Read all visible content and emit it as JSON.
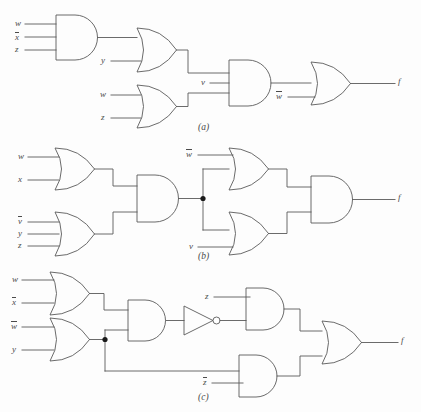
{
  "figure": {
    "type": "logic-circuit-diagram",
    "background_color": "#fdfdfd",
    "line_color": "#5a5a5a",
    "text_color": "#4a4a4a",
    "panels": [
      {
        "caption": "(a)",
        "output_label": "f",
        "gates": [
          {
            "name": "and-gate-a1",
            "kind": "AND",
            "inputs": [
              "w",
              "x̅",
              "z"
            ]
          },
          {
            "name": "or-gate-a1",
            "kind": "OR",
            "inputs": [
              "and-gate-a1",
              "y"
            ]
          },
          {
            "name": "or-gate-a2",
            "kind": "OR",
            "inputs": [
              "w",
              "z"
            ]
          },
          {
            "name": "and-gate-a2",
            "kind": "AND",
            "inputs": [
              "or-gate-a1",
              "v",
              "or-gate-a2"
            ]
          },
          {
            "name": "or-gate-a3",
            "kind": "OR",
            "inputs": [
              "and-gate-a2",
              "w̅"
            ]
          }
        ],
        "input_labels": [
          {
            "text": "w",
            "overbar": false
          },
          {
            "text": "x",
            "overbar": true
          },
          {
            "text": "z",
            "overbar": false
          },
          {
            "text": "y",
            "overbar": false
          },
          {
            "text": "w",
            "overbar": false
          },
          {
            "text": "z",
            "overbar": false
          },
          {
            "text": "v",
            "overbar": false
          },
          {
            "text": "w",
            "overbar": true
          }
        ]
      },
      {
        "caption": "(b)",
        "output_label": "f",
        "gates": [
          {
            "name": "or-gate-b1",
            "kind": "OR",
            "inputs": [
              "w",
              "x"
            ]
          },
          {
            "name": "or-gate-b2",
            "kind": "OR",
            "inputs": [
              "v̅",
              "y",
              "z"
            ]
          },
          {
            "name": "and-gate-b1",
            "kind": "AND",
            "inputs": [
              "or-gate-b1",
              "or-gate-b2"
            ]
          },
          {
            "name": "or-gate-b3",
            "kind": "OR",
            "inputs": [
              "w̅",
              "and-gate-b1"
            ]
          },
          {
            "name": "or-gate-b4",
            "kind": "OR",
            "inputs": [
              "and-gate-b1",
              "v"
            ]
          },
          {
            "name": "and-gate-b2",
            "kind": "AND",
            "inputs": [
              "or-gate-b3",
              "or-gate-b4"
            ]
          }
        ],
        "input_labels": [
          {
            "text": "w",
            "overbar": false
          },
          {
            "text": "x",
            "overbar": false
          },
          {
            "text": "v",
            "overbar": true
          },
          {
            "text": "y",
            "overbar": false
          },
          {
            "text": "z",
            "overbar": false
          },
          {
            "text": "w",
            "overbar": true
          },
          {
            "text": "v",
            "overbar": false
          }
        ],
        "has_junction_dot": true
      },
      {
        "caption": "(c)",
        "output_label": "f",
        "gates": [
          {
            "name": "or-gate-c1",
            "kind": "OR",
            "inputs": [
              "w",
              "x̅"
            ]
          },
          {
            "name": "or-gate-c2",
            "kind": "OR",
            "inputs": [
              "w̅",
              "y"
            ]
          },
          {
            "name": "and-gate-c1",
            "kind": "AND",
            "inputs": [
              "or-gate-c1",
              "or-gate-c2"
            ]
          },
          {
            "name": "not-gate-c1",
            "kind": "NOT",
            "inputs": [
              "and-gate-c1"
            ]
          },
          {
            "name": "and-gate-c2",
            "kind": "AND",
            "inputs": [
              "z",
              "not-gate-c1"
            ]
          },
          {
            "name": "and-gate-c3",
            "kind": "AND",
            "inputs": [
              "or-gate-c2",
              "z̅"
            ]
          },
          {
            "name": "or-gate-c3",
            "kind": "OR",
            "inputs": [
              "and-gate-c2",
              "and-gate-c3"
            ]
          }
        ],
        "input_labels": [
          {
            "text": "w",
            "overbar": false
          },
          {
            "text": "x",
            "overbar": true
          },
          {
            "text": "w",
            "overbar": true
          },
          {
            "text": "y",
            "overbar": false
          },
          {
            "text": "z",
            "overbar": false
          },
          {
            "text": "z",
            "overbar": true
          }
        ],
        "has_junction_dot": true
      }
    ]
  },
  "labels": {
    "a": {
      "in1": "w",
      "in2": "x",
      "in3": "z",
      "in4": "y",
      "in5": "w",
      "in6": "z",
      "in7": "v",
      "in8": "w",
      "out": "f",
      "caption": "(a)"
    },
    "b": {
      "in1": "w",
      "in2": "x",
      "in3": "v",
      "in4": "y",
      "in5": "z",
      "in6": "w",
      "in7": "v",
      "out": "f",
      "caption": "(b)"
    },
    "c": {
      "in1": "w",
      "in2": "x",
      "in3": "w",
      "in4": "y",
      "in5": "z",
      "in6": "z",
      "out": "f",
      "caption": "(c)"
    }
  }
}
